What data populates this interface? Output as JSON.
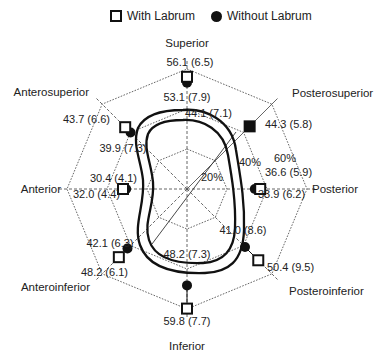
{
  "chart_data": {
    "type": "radar",
    "title": "",
    "legend": {
      "position": "top",
      "entries": [
        {
          "name": "With Labrum",
          "marker": "open-square"
        },
        {
          "name": "Without Labrum",
          "marker": "filled-circle"
        }
      ]
    },
    "axes": [
      "Superior",
      "Posterosuperior",
      "Posterior",
      "Posteroinferior",
      "Inferior",
      "Anteroinferior",
      "Anterior",
      "Anterosuperior"
    ],
    "rings": [
      {
        "label": "20%",
        "value": 20
      },
      {
        "label": "40%",
        "value": 40
      },
      {
        "label": "60%",
        "value": 60
      }
    ],
    "series": [
      {
        "name": "With Labrum",
        "values": [
          56.1,
          44.3,
          36.6,
          50.4,
          59.8,
          48.2,
          32.0,
          43.7
        ],
        "sd": [
          6.5,
          5.8,
          5.9,
          9.5,
          7.7,
          6.1,
          4.4,
          6.6
        ],
        "labels": [
          "56.1 (6.5)",
          "44.3 (5.8)",
          "36.6 (5.9)",
          "50.4 (9.5)",
          "59.8 (7.7)",
          "48.2 (6.1)",
          "32.0 (4.4)",
          "43.7 (6.6)"
        ]
      },
      {
        "name": "Without Labrum",
        "values": [
          53.1,
          44.1,
          33.9,
          41.0,
          48.2,
          42.1,
          30.4,
          39.9
        ],
        "sd": [
          7.9,
          7.1,
          6.2,
          8.6,
          7.3,
          6.3,
          4.1,
          7.3
        ],
        "labels": [
          "53.1 (7.9)",
          "44.1 (7.1)",
          "33.9 (6.2)",
          "41.0 (8.6)",
          "48.2 (7.3)",
          "42.1 (6.3)",
          "30.4 (4.1)",
          "39.9 (7.3)"
        ]
      }
    ],
    "rlim": [
      0,
      60
    ],
    "grid": true
  },
  "legend": {
    "with_label": "With Labrum",
    "without_label": "Without Labrum"
  },
  "colors": {
    "ink": "#111111",
    "grid": "#555555"
  }
}
